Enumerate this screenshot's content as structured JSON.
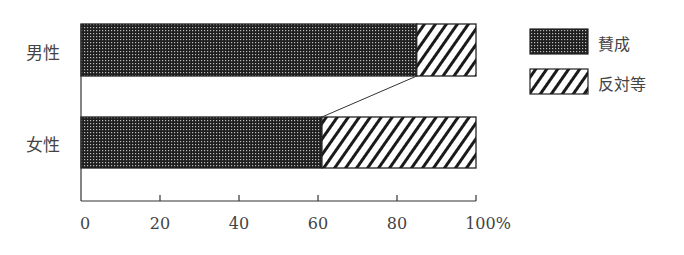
{
  "chart_data": {
    "type": "bar",
    "orientation": "horizontal",
    "stacked": true,
    "percent": true,
    "categories": [
      "男性",
      "女性"
    ],
    "series": [
      {
        "name": "賛成",
        "values": [
          85,
          61
        ],
        "pattern": "dots-dark"
      },
      {
        "name": "反対等",
        "values": [
          15,
          39
        ],
        "pattern": "diagonal-hatch"
      }
    ],
    "title": "",
    "xlabel": "",
    "ylabel": "",
    "xlim": [
      0,
      100
    ],
    "x_ticks": [
      "0",
      "20",
      "40",
      "60",
      "80",
      "100%"
    ],
    "grid": false,
    "legend_position": "right",
    "annotations": [
      "connector line between 賛成/反対等 boundaries of 男性 and 女性"
    ]
  },
  "labels": {
    "category_male": "男性",
    "category_female": "女性",
    "legend_agree": "賛成",
    "legend_oppose": "反対等",
    "ticks": [
      "0",
      "20",
      "40",
      "60",
      "80",
      "100%"
    ]
  },
  "colors": {
    "dark_fill": "#2a2a2a",
    "line": "#222222",
    "background": "#ffffff"
  }
}
